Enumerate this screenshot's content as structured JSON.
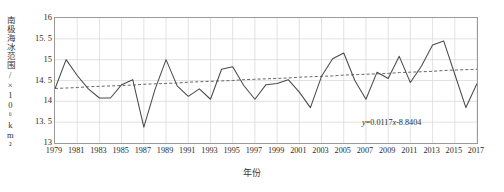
{
  "chart_data": {
    "type": "line",
    "title": "",
    "xlabel": "年份",
    "ylabel": "南极海冰范围/×10⁶km²",
    "ylabel_main": "南极海冰范围/",
    "ylabel_unit_prefix": "×10",
    "ylabel_unit_exp": "6",
    "ylabel_unit_suffix": "km",
    "ylabel_unit_exp2": "2",
    "xlim": [
      1979,
      2017
    ],
    "ylim": [
      13,
      16
    ],
    "yticks": [
      13,
      13.5,
      14,
      14.5,
      15,
      15.5,
      16
    ],
    "ytick_labels": [
      "13",
      "13. 5",
      "14",
      "14. 5",
      "15",
      "15. 5",
      "16"
    ],
    "xticks": [
      1979,
      1981,
      1983,
      1985,
      1987,
      1989,
      1991,
      1993,
      1995,
      1997,
      1999,
      2001,
      2003,
      2005,
      2007,
      2009,
      2011,
      2013,
      2015,
      2017
    ],
    "xtick_labels": [
      "1979",
      "1981",
      "1983",
      "1985",
      "1987",
      "1989",
      "1991",
      "1993",
      "1995",
      "1997",
      "1999",
      "2001",
      "2003",
      "2005",
      "2007",
      "2009",
      "2011",
      "2013",
      "2015",
      "2017"
    ],
    "grid": true,
    "grid_x_step": 2,
    "grid_y_step": 0.5,
    "legend": null,
    "x": [
      1979,
      1980,
      1981,
      1982,
      1983,
      1984,
      1985,
      1986,
      1987,
      1988,
      1989,
      1990,
      1991,
      1992,
      1993,
      1994,
      1995,
      1996,
      1997,
      1998,
      1999,
      2000,
      2001,
      2002,
      2003,
      2004,
      2005,
      2006,
      2007,
      2008,
      2009,
      2010,
      2011,
      2012,
      2013,
      2014,
      2015,
      2016,
      2017
    ],
    "series": [
      {
        "name": "南极海冰范围",
        "color": "#4a4a4a",
        "style": "solid",
        "values": [
          14.3,
          15.0,
          14.62,
          14.3,
          14.08,
          14.08,
          14.4,
          14.52,
          13.38,
          14.28,
          15.0,
          14.37,
          14.12,
          14.3,
          14.05,
          14.77,
          14.83,
          14.38,
          14.05,
          14.4,
          14.43,
          14.52,
          14.22,
          13.85,
          14.6,
          15.02,
          15.16,
          14.5,
          14.05,
          14.7,
          14.55,
          15.08,
          14.45,
          14.85,
          15.35,
          15.45,
          14.65,
          13.85,
          14.43
        ]
      },
      {
        "name": "线性趋势线",
        "color": "#555555",
        "style": "dashed",
        "equation": "y=0.0117x-8.8404",
        "slope": 0.0117,
        "intercept": -8.8404,
        "values": [
          14.31,
          14.32,
          14.33,
          14.35,
          14.36,
          14.37,
          14.38,
          14.39,
          14.41,
          14.42,
          14.43,
          14.44,
          14.46,
          14.47,
          14.48,
          14.49,
          14.5,
          14.52,
          14.53,
          14.54,
          14.55,
          14.56,
          14.58,
          14.59,
          14.6,
          14.61,
          14.63,
          14.64,
          14.65,
          14.66,
          14.67,
          14.69,
          14.7,
          14.71,
          14.72,
          14.74,
          14.75,
          14.76,
          14.77
        ]
      }
    ],
    "annotations": [
      {
        "name": "trend-equation",
        "text": "y=0.0117x-8.8404",
        "text_var": "y",
        "text_rest": "=0.0117",
        "text_var2": "x",
        "text_tail": "-8.8404"
      }
    ]
  }
}
